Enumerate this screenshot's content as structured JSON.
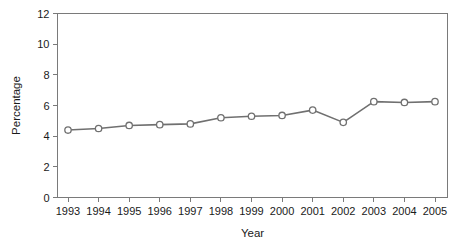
{
  "chart_data": {
    "type": "line",
    "title": "",
    "subtitle": "",
    "xlabel": "Year",
    "ylabel": "Percentage",
    "categories": [
      "1993",
      "1994",
      "1995",
      "1996",
      "1997",
      "1998",
      "1999",
      "2000",
      "2001",
      "2002",
      "2003",
      "2004",
      "2005"
    ],
    "x": [
      1993,
      1994,
      1995,
      1996,
      1997,
      1998,
      1999,
      2000,
      2001,
      2002,
      2003,
      2004,
      2005
    ],
    "values": [
      4.4,
      4.5,
      4.7,
      4.75,
      4.8,
      5.2,
      5.3,
      5.35,
      5.7,
      4.9,
      6.25,
      6.2,
      6.25
    ],
    "series": [
      {
        "name": "Percentage",
        "values": [
          4.4,
          4.5,
          4.7,
          4.75,
          4.8,
          5.2,
          5.3,
          5.35,
          5.7,
          4.9,
          6.25,
          6.2,
          6.25
        ]
      }
    ],
    "ylim": [
      0,
      12
    ],
    "yticks": [
      0,
      2,
      4,
      6,
      8,
      10,
      12
    ],
    "ytick_labels": [
      "0",
      "2",
      "4",
      "6",
      "8",
      "10",
      "12"
    ],
    "xtick_labels": [
      "1993",
      "1994",
      "1995",
      "1996",
      "1997",
      "1998",
      "1999",
      "2000",
      "2001",
      "2002",
      "2003",
      "2004",
      "2005"
    ],
    "grid": false,
    "legend": false,
    "legend_position": "none",
    "marker": "open-circle",
    "line_color": "#707070",
    "marker_fill": "#ffffff",
    "marker_edge_color": "#707070",
    "frame_color": "#7a7a7a",
    "background_color": "#ffffff",
    "annotations": []
  }
}
